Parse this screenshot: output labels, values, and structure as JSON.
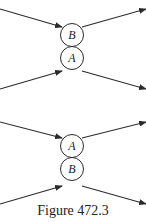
{
  "caption": "Figure 472.3",
  "colors": {
    "stroke": "#2a2a2a",
    "background": "#ffffff"
  },
  "diagrams": [
    {
      "name": "top",
      "nodes": [
        {
          "label": "B",
          "cx": 72,
          "cy": 35,
          "r": 11.5
        },
        {
          "label": "A",
          "cx": 72,
          "cy": 58,
          "r": 11.5
        }
      ],
      "arrows": [
        {
          "from": [
            0,
            9
          ],
          "to": [
            62,
            27
          ],
          "direction": "incoming"
        },
        {
          "from": [
            82,
            27
          ],
          "to": [
            146,
            9
          ],
          "direction": "outgoing"
        },
        {
          "from": [
            0,
            89
          ],
          "to": [
            62,
            71
          ],
          "direction": "incoming"
        },
        {
          "from": [
            82,
            71
          ],
          "to": [
            146,
            89
          ],
          "direction": "outgoing"
        }
      ]
    },
    {
      "name": "bottom",
      "nodes": [
        {
          "label": "A",
          "cx": 72,
          "cy": 146,
          "r": 11.5
        },
        {
          "label": "B",
          "cx": 72,
          "cy": 169,
          "r": 11.5
        }
      ],
      "arrows": [
        {
          "from": [
            0,
            122
          ],
          "to": [
            62,
            138
          ],
          "direction": "incoming"
        },
        {
          "from": [
            82,
            138
          ],
          "to": [
            146,
            122
          ],
          "direction": "outgoing"
        },
        {
          "from": [
            0,
            204
          ],
          "to": [
            62,
            186
          ],
          "direction": "incoming"
        },
        {
          "from": [
            82,
            186
          ],
          "to": [
            146,
            204
          ],
          "direction": "outgoing"
        }
      ]
    }
  ]
}
